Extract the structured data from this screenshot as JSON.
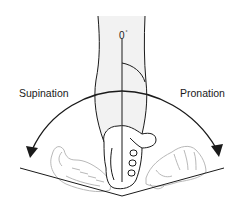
{
  "diagram": {
    "labels": {
      "left": "Supination",
      "right": "Pronation",
      "zero": "0",
      "degree_symbol": "°"
    },
    "colors": {
      "ink": "#1a1a1a",
      "arm_fill": "#f2f2f2",
      "hand_ghost": "#b0b0b0",
      "background": "#ffffff"
    }
  }
}
